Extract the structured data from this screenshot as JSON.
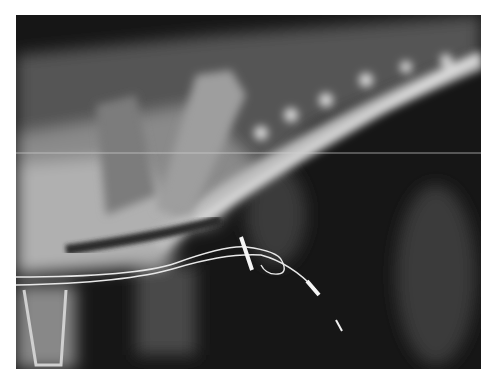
{
  "image": {
    "type": "radiograph",
    "description": "Lateral thoracic X-ray showing spine, ribs and pacing lead wires",
    "colors": {
      "background": "#ffffff",
      "film": "#151515",
      "bone": "#e6e6e6",
      "wire": "#f2f2f2"
    }
  }
}
